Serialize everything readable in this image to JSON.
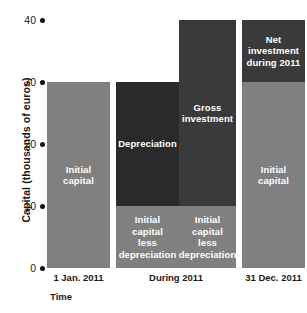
{
  "chart_data": {
    "type": "bar",
    "title": "",
    "subtitle": "",
    "xlabel": "Time",
    "ylabel": "Capital (thousands of euros)",
    "ylim": [
      0,
      40
    ],
    "yticks": [
      0,
      10,
      20,
      30,
      40
    ],
    "ytick_labels": [
      "0",
      "10",
      "20",
      "30",
      "40"
    ],
    "grid": false,
    "legend": "none",
    "stacked": true,
    "categories": [
      "1 Jan. 2011",
      "During 2011",
      "31 Dec. 2011"
    ],
    "colors": {
      "gray": "#808080",
      "dark_black": "#2a2a2a",
      "dark_charcoal": "#3a3a3a",
      "background": "#ffffff",
      "text": "#1a1a1a",
      "bar_label_text": "#ffffff",
      "tick_dot": "#111111"
    },
    "bars": [
      {
        "id": "bar-initial-capital",
        "category": "1 Jan. 2011",
        "total": 30,
        "segments": [
          {
            "label": "Initial\ncapital",
            "from": 0,
            "to": 30,
            "value": 30,
            "color": "#808080"
          }
        ]
      },
      {
        "id": "bar-depreciation",
        "category": "During 2011",
        "total": 30,
        "segments": [
          {
            "label": "Initial\ncapital\nless\ndepreciation",
            "from": 0,
            "to": 10,
            "value": 10,
            "color": "#808080"
          },
          {
            "label": "Depreciation",
            "from": 10,
            "to": 30,
            "value": 20,
            "color": "#2a2a2a"
          }
        ]
      },
      {
        "id": "bar-gross-investment",
        "category": "During 2011",
        "total": 40,
        "segments": [
          {
            "label": "Initial\ncapital\nless\ndepreciation",
            "from": 0,
            "to": 10,
            "value": 10,
            "color": "#808080"
          },
          {
            "label": "Gross\ninvestment",
            "from": 10,
            "to": 40,
            "value": 30,
            "color": "#3a3a3a"
          }
        ]
      },
      {
        "id": "bar-net-investment",
        "category": "31 Dec. 2011",
        "total": 40,
        "segments": [
          {
            "label": "Initial\ncapital",
            "from": 0,
            "to": 30,
            "value": 30,
            "color": "#808080"
          },
          {
            "label": "Net\ninvestment\nduring 2011",
            "from": 30,
            "to": 40,
            "value": 10,
            "color": "#3a3a3a"
          }
        ]
      }
    ],
    "bar_geometry": [
      {
        "left": 0,
        "width": 63
      },
      {
        "left": 69,
        "width": 63
      },
      {
        "left": 132,
        "width": 57
      },
      {
        "left": 195,
        "width": 63
      }
    ],
    "category_label_geometry": [
      {
        "left": 0,
        "width": 63
      },
      {
        "left": 69,
        "width": 120
      },
      {
        "left": 195,
        "width": 63
      }
    ]
  }
}
